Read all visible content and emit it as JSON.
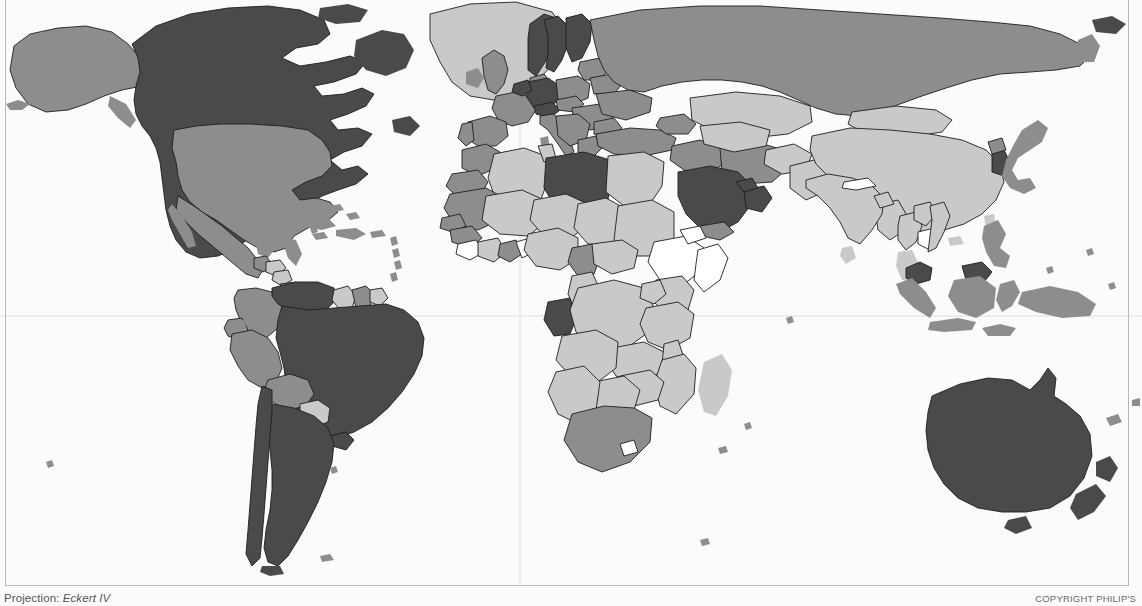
{
  "map": {
    "title": "World choropleth map",
    "projection_label": "Projection:",
    "projection_name": "Eckert IV",
    "copyright": "COPYRIGHT PHILIP'S",
    "background_color": "#fbfbfa",
    "graticule": {
      "visible": true,
      "color": "#dedede",
      "equator_label": "Equator",
      "central_meridian_label": "Prime Meridian"
    },
    "legend_classes": [
      {
        "key": "darkest",
        "color": "#4a4a4d",
        "label": "Highest class"
      },
      {
        "key": "medium",
        "color": "#8d8d90",
        "label": "Upper middle class"
      },
      {
        "key": "light",
        "color": "#c9c9c9",
        "label": "Lower middle class"
      },
      {
        "key": "lightest",
        "color": "#ffffff",
        "label": "Lowest class / no data"
      }
    ],
    "border_color": "#1e1e1e",
    "regions": [
      {
        "name": "Canada",
        "class": "darkest"
      },
      {
        "name": "United States",
        "class": "medium"
      },
      {
        "name": "Greenland",
        "class": "light"
      },
      {
        "name": "Mexico",
        "class": "medium"
      },
      {
        "name": "Central America",
        "class": "medium"
      },
      {
        "name": "Caribbean",
        "class": "medium"
      },
      {
        "name": "Venezuela",
        "class": "darkest"
      },
      {
        "name": "Colombia",
        "class": "medium"
      },
      {
        "name": "Guyana",
        "class": "light"
      },
      {
        "name": "Brazil",
        "class": "darkest"
      },
      {
        "name": "Peru",
        "class": "medium"
      },
      {
        "name": "Bolivia",
        "class": "medium"
      },
      {
        "name": "Paraguay",
        "class": "light"
      },
      {
        "name": "Chile",
        "class": "darkest"
      },
      {
        "name": "Argentina",
        "class": "darkest"
      },
      {
        "name": "United Kingdom",
        "class": "medium"
      },
      {
        "name": "Norway",
        "class": "darkest"
      },
      {
        "name": "Sweden",
        "class": "darkest"
      },
      {
        "name": "Finland",
        "class": "darkest"
      },
      {
        "name": "Germany",
        "class": "darkest"
      },
      {
        "name": "France",
        "class": "medium"
      },
      {
        "name": "Spain",
        "class": "medium"
      },
      {
        "name": "Italy",
        "class": "medium"
      },
      {
        "name": "Poland",
        "class": "medium"
      },
      {
        "name": "Russia",
        "class": "medium"
      },
      {
        "name": "Turkey",
        "class": "medium"
      },
      {
        "name": "Kazakhstan",
        "class": "light"
      },
      {
        "name": "Mongolia",
        "class": "light"
      },
      {
        "name": "China",
        "class": "light"
      },
      {
        "name": "India",
        "class": "light"
      },
      {
        "name": "Pakistan",
        "class": "light"
      },
      {
        "name": "Nepal",
        "class": "lightest"
      },
      {
        "name": "South Korea",
        "class": "darkest"
      },
      {
        "name": "Japan",
        "class": "medium"
      },
      {
        "name": "Cambodia",
        "class": "lightest"
      },
      {
        "name": "Malaysia",
        "class": "darkest"
      },
      {
        "name": "Indonesia",
        "class": "medium"
      },
      {
        "name": "Philippines",
        "class": "medium"
      },
      {
        "name": "Libya",
        "class": "darkest"
      },
      {
        "name": "Egypt",
        "class": "light"
      },
      {
        "name": "Algeria",
        "class": "light"
      },
      {
        "name": "Morocco",
        "class": "medium"
      },
      {
        "name": "Mauritania",
        "class": "medium"
      },
      {
        "name": "Saudi Arabia",
        "class": "darkest"
      },
      {
        "name": "Oman",
        "class": "darkest"
      },
      {
        "name": "Ethiopia",
        "class": "lightest"
      },
      {
        "name": "Somalia",
        "class": "lightest"
      },
      {
        "name": "Gabon",
        "class": "darkest"
      },
      {
        "name": "South Africa",
        "class": "medium"
      },
      {
        "name": "Lesotho",
        "class": "lightest"
      },
      {
        "name": "Madagascar",
        "class": "light"
      },
      {
        "name": "Australia",
        "class": "darkest"
      },
      {
        "name": "New Zealand",
        "class": "darkest"
      },
      {
        "name": "Papua New Guinea",
        "class": "medium"
      }
    ]
  }
}
